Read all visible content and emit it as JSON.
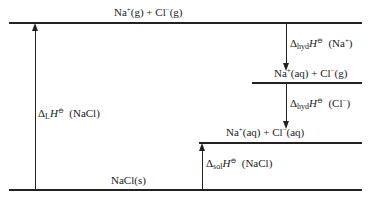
{
  "diagram": {
    "type": "Born-Haber / enthalpy cycle for dissolution of NaCl",
    "levels": [
      {
        "id": "gas-ions",
        "label": "Na⁺(g) + Cl⁻(g)",
        "na": "Na",
        "na_charge": "+",
        "na_state": "(g)",
        "plus": " + ",
        "cl": "Cl",
        "cl_charge": "−",
        "cl_state": "(g)"
      },
      {
        "id": "na-aq-cl-g",
        "label": "Na⁺(aq) + Cl⁻(g)",
        "na": "Na",
        "na_charge": "+",
        "na_state": "(aq)",
        "plus": " + ",
        "cl": "Cl",
        "cl_charge": "−",
        "cl_state": "(g)"
      },
      {
        "id": "aq-ions",
        "label": "Na⁺(aq) + Cl⁻(aq)",
        "na": "Na",
        "na_charge": "+",
        "na_state": "(aq)",
        "plus": " + ",
        "cl": "Cl",
        "cl_charge": "−",
        "cl_state": "(aq)"
      },
      {
        "id": "solid",
        "label": "NaCl(s)"
      }
    ],
    "arrows": [
      {
        "id": "lattice",
        "delta": "Δ",
        "sub": "L",
        "H": "H",
        "sup": "⊖",
        "species": "  (NaCl)",
        "direction": "up"
      },
      {
        "id": "hyd-na",
        "delta": "Δ",
        "sub": "hyd",
        "H": "H",
        "sup": "⊖",
        "species_pre": "  (Na",
        "charge": "+",
        "species_post": ")",
        "direction": "down"
      },
      {
        "id": "hyd-cl",
        "delta": "Δ",
        "sub": "hyd",
        "H": "H",
        "sup": "⊖",
        "species_pre": "  (Cl",
        "charge": "−",
        "species_post": ")",
        "direction": "down"
      },
      {
        "id": "sol",
        "delta": "Δ",
        "sub": "sol",
        "H": "H",
        "sup": "⊖",
        "species": "  (NaCl)",
        "direction": "up"
      }
    ]
  }
}
